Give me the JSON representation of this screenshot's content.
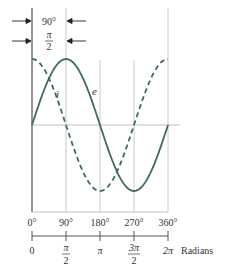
{
  "figure": {
    "phase_annotation": {
      "degrees": "90°",
      "radians_num": "π",
      "radians_den": "2"
    },
    "curves": [
      {
        "name": "e",
        "label": "e",
        "style": "solid",
        "function": "sin",
        "color": "#3d6b5f"
      },
      {
        "name": "i",
        "label": "i",
        "style": "dashed",
        "function": "cos",
        "color": "#3d6b5f"
      }
    ],
    "degree_axis": {
      "ticks": [
        "0°",
        "90°",
        "180°",
        "270°",
        "360°"
      ]
    },
    "radian_axis": {
      "ticks": [
        {
          "num": "0",
          "den": ""
        },
        {
          "num": "π",
          "den": "2"
        },
        {
          "num": "π",
          "den": ""
        },
        {
          "num": "3π",
          "den": "2"
        },
        {
          "num": "2π",
          "den": ""
        }
      ],
      "unit_label": "Radians"
    },
    "colors": {
      "curve": "#3d6b5f",
      "grid": "#b8b8b8",
      "axis": "#444444"
    }
  }
}
